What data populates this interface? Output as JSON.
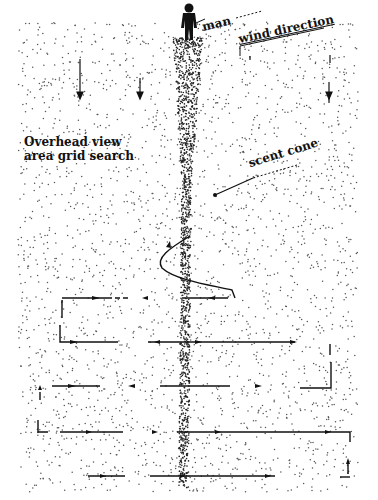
{
  "diagram": {
    "title_lines": [
      "Overhead view",
      "area grid search"
    ],
    "labels": {
      "man": "man",
      "wind_direction": "wind direction",
      "scent_cone": "scent cone"
    },
    "colors": {
      "background": "#ffffff",
      "dots": "#555555",
      "ink": "#111111"
    },
    "elements": [
      {
        "id": "man-figure",
        "type": "silhouette",
        "x": 188,
        "y": 12
      },
      {
        "id": "scent-cone",
        "type": "dense-dot-plume",
        "from": [
          188,
          40
        ],
        "to": [
          183,
          490
        ]
      },
      {
        "id": "wind-arrows",
        "type": "downward-arrows",
        "count": 4
      },
      {
        "id": "dog-path-spiral",
        "type": "s-curve",
        "near_y": [
          220,
          300
        ]
      },
      {
        "id": "search-grid",
        "type": "serpentine-path",
        "rows_y": [
          298,
          343,
          387,
          432,
          476
        ]
      }
    ]
  }
}
